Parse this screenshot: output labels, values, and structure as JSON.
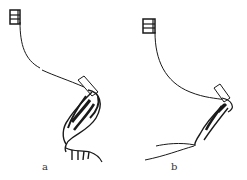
{
  "figure": {
    "panels": [
      {
        "id": "a",
        "label": "a",
        "description": "flexed leg preparation with claws, suspended by thread from clamp"
      },
      {
        "id": "b",
        "label": "b",
        "description": "extended leg preparation with trailing thread, suspended from clamp"
      }
    ],
    "colors": {
      "ink": "#1a1a1a",
      "background": "#ffffff"
    }
  }
}
